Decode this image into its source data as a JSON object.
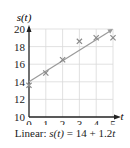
{
  "chart_data": {
    "type": "scatter",
    "title": "",
    "xlabel": "t",
    "ylabel": "s(t)",
    "xlim": [
      0,
      5
    ],
    "ylim": [
      10,
      20
    ],
    "x_ticks": [
      "0",
      "1",
      "2",
      "3",
      "4",
      "5"
    ],
    "y_ticks": [
      "10",
      "12",
      "14",
      "16",
      "18",
      "20"
    ],
    "grid": true,
    "series": [
      {
        "name": "Data",
        "marker": "x",
        "x": [
          0,
          1,
          2,
          3,
          4,
          5
        ],
        "y": [
          13.6,
          15.0,
          16.5,
          18.6,
          19.0,
          19.0
        ]
      },
      {
        "name": "Linear fit",
        "type": "line",
        "equation": "s(t) = 14 + 1.2t",
        "intercept": 14,
        "slope": 1.2,
        "x": [
          0,
          5
        ],
        "y": [
          14,
          20
        ]
      }
    ],
    "annotation": "Linear: s(t) = 14 + 1.2t"
  },
  "caption": {
    "prefix": "Linear: ",
    "func": "s(t)",
    "rhs_a": " = 14 + 1.2",
    "var": "t"
  },
  "colors": {
    "axis": "#222222",
    "grid": "#d9d9d9",
    "marker": "#8a8a8a",
    "fit_line": "#9a9a9a"
  }
}
